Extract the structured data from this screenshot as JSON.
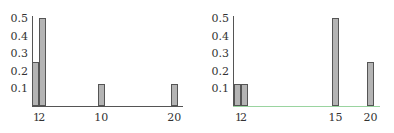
{
  "chart_data": [
    {
      "type": "bar",
      "title": "",
      "xlabel": "",
      "ylabel": "",
      "x": [
        1,
        2,
        10,
        20
      ],
      "values": [
        0.25,
        0.5,
        0.125,
        0.125
      ],
      "xtick_labels": [
        "1",
        "2",
        "10",
        "20"
      ],
      "ytick_labels": [
        "0.1",
        "0.2",
        "0.3",
        "0.4",
        "0.5"
      ],
      "ylim": [
        0,
        0.5
      ],
      "xlim": [
        1,
        21
      ],
      "grid": false,
      "legend": null,
      "bar_color": "#b4b4b4"
    },
    {
      "type": "bar",
      "title": "",
      "xlabel": "",
      "ylabel": "",
      "x": [
        1,
        2,
        15,
        20
      ],
      "values": [
        0.125,
        0.125,
        0.5,
        0.25
      ],
      "xtick_labels": [
        "1",
        "2",
        "15",
        "20"
      ],
      "ytick_labels": [
        "0.1",
        "0.2",
        "0.3",
        "0.4",
        "0.5"
      ],
      "ylim": [
        0,
        0.5
      ],
      "xlim": [
        1,
        21
      ],
      "grid": false,
      "legend": null,
      "bar_color": "#b4b4b4"
    }
  ]
}
